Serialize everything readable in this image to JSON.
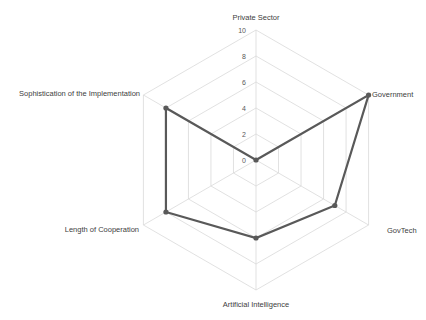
{
  "chart_data": {
    "type": "radar",
    "title": "",
    "categories": [
      "Private Sector",
      "Government",
      "GovTech",
      "Artificial Intelligence",
      "Length of Cooperation",
      "Sophistication of the Implementation"
    ],
    "series": [
      {
        "name": "Series 1",
        "values": [
          0,
          10,
          7,
          6,
          8,
          8
        ],
        "color": "#595959"
      }
    ],
    "radial_ticks": [
      0,
      2,
      4,
      6,
      8,
      10
    ],
    "range": [
      0,
      10
    ],
    "grid": true,
    "grid_color": "#d9d9d9",
    "legend": "none"
  }
}
